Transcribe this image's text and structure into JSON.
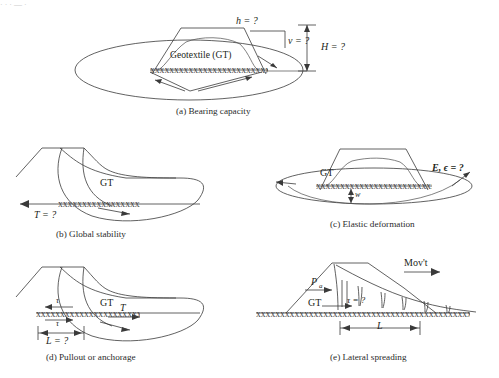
{
  "figure": {
    "cropped_header_text": "· ·  ·  —   ·",
    "geotextile_marker": "xxxxxxxxxxxxxxxxxxxxxxxxxxxxxxxxxxxxxxxxxxxxxxxx",
    "ink_color": "#3a3a3a",
    "panels": [
      {
        "id": "a",
        "caption": "(a) Bearing capacity",
        "labels": [
          {
            "name": "h-label",
            "text": "h = ?"
          },
          {
            "name": "v-label",
            "text": "v = ?"
          },
          {
            "name": "H-label",
            "text": "H = ?"
          },
          {
            "name": "geotextile-callout",
            "text": "Geotextile (GT)"
          }
        ]
      },
      {
        "id": "b",
        "caption": "(b) Global stability",
        "labels": [
          {
            "name": "gt-label",
            "text": "GT"
          },
          {
            "name": "T-label",
            "text": "T = ?"
          }
        ]
      },
      {
        "id": "c",
        "caption": "(c) Elastic deformation",
        "labels": [
          {
            "name": "gt-label",
            "text": "GT"
          },
          {
            "name": "modulus-strain-label",
            "text": "E, ϵ = ?"
          },
          {
            "name": "w-label",
            "text": "w"
          }
        ]
      },
      {
        "id": "d",
        "caption": "(d) Pullout or anchorage",
        "labels": [
          {
            "name": "gt-label",
            "text": "GT"
          },
          {
            "name": "T-label",
            "text": "T"
          },
          {
            "name": "tau-top-label",
            "text": "τ"
          },
          {
            "name": "tau-bottom-label",
            "text": "τ"
          },
          {
            "name": "L-label",
            "text": "L = ?"
          }
        ]
      },
      {
        "id": "e",
        "caption": "(e) Lateral spreading",
        "labels": [
          {
            "name": "movement-label",
            "text": "Mov't"
          },
          {
            "name": "active-pressure-label",
            "text": "P"
          },
          {
            "name": "active-pressure-subscript",
            "text": "a"
          },
          {
            "name": "gt-label",
            "text": "GT"
          },
          {
            "name": "tau-label",
            "text": "τ = ?"
          },
          {
            "name": "L-label",
            "text": "L"
          }
        ]
      }
    ]
  }
}
